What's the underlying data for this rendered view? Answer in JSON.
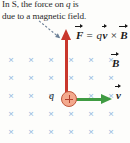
{
  "figure": {
    "caption_line1_a": "In S, the force on ",
    "caption_line1_q": "q",
    "caption_line1_b": " is",
    "caption_line2": "due to a magnetic field."
  },
  "equation": {
    "force_symbol": "F",
    "equals": " = ",
    "charge_symbol": "q",
    "velocity_symbol": "v",
    "cross": " × ",
    "field_symbol": "B"
  },
  "labels": {
    "field_label": "B",
    "velocity_label": "v",
    "charge_label": "q"
  },
  "field": {
    "mark_glyph": "×",
    "columns": 6,
    "rows": 5,
    "x_start": 11,
    "x_step": 20,
    "y_start": 59,
    "y_step": 18,
    "mark_color": "#8fb8e0",
    "meaning": "magnetic-field-into-page"
  },
  "colors": {
    "force_arrow": "#c9372c",
    "velocity_arrow": "#3f9b42",
    "charge_fill": "#f3a98d",
    "charge_stroke": "#c0573c",
    "leader_line": "#6b7f96",
    "background": "#fdfdfb",
    "text": "#2b2b2b"
  }
}
